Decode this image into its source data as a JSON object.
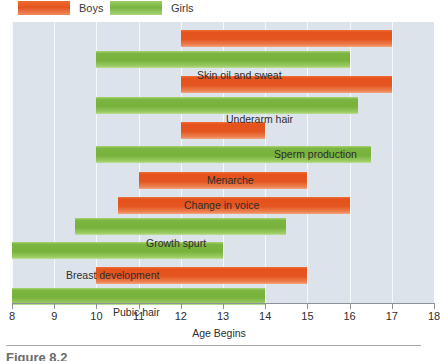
{
  "legend": {
    "items": [
      {
        "label": "Boys",
        "color": "#e4551f",
        "icon": "legend-swatch-boys"
      },
      {
        "label": "Girls",
        "color": "#77b23c",
        "icon": "legend-swatch-girls"
      }
    ]
  },
  "axis": {
    "title": "Age Begins",
    "ticks": [
      "8",
      "9",
      "10",
      "11",
      "12",
      "13",
      "14",
      "15",
      "16",
      "17",
      "18"
    ]
  },
  "caption": {
    "text": "Figure 8.2"
  },
  "chart_data": {
    "type": "bar",
    "orientation": "horizontal",
    "title": "",
    "subtitle": "",
    "xlabel": "Age Begins",
    "ylabel": "",
    "xlim": [
      8,
      18
    ],
    "grid": true,
    "legend_position": "top-left",
    "note": "Paired floating (range) bars: each milestone shows the age span during which it typically begins, separately for boys (orange) and girls (green).",
    "series": [
      {
        "name": "Boys",
        "color": "#e4551f"
      },
      {
        "name": "Girls",
        "color": "#77b23c"
      }
    ],
    "categories": [
      "Skin oil and sweat",
      "Underarm hair",
      "Sperm production",
      "Menarche",
      "Change in voice",
      "Growth spurt",
      "Breast development",
      "Pubic hair"
    ],
    "bars": [
      {
        "label": "Skin oil and sweat",
        "series": "Boys",
        "start": 12.0,
        "end": 17.0
      },
      {
        "label": "Skin oil and sweat",
        "series": "Girls",
        "start": 10.0,
        "end": 16.0
      },
      {
        "label": "Underarm hair",
        "series": "Boys",
        "start": 12.0,
        "end": 17.0
      },
      {
        "label": "Underarm hair",
        "series": "Girls",
        "start": 10.0,
        "end": 16.2
      },
      {
        "label": "Sperm production",
        "series": "Boys",
        "start": 12.0,
        "end": 14.0
      },
      {
        "label": "Menarche",
        "series": "Girls",
        "start": 10.0,
        "end": 16.5
      },
      {
        "label": "Change in voice",
        "series": "Boys",
        "start": 11.0,
        "end": 15.0
      },
      {
        "label": "Growth spurt",
        "series": "Boys",
        "start": 10.5,
        "end": 16.0
      },
      {
        "label": "Growth spurt",
        "series": "Girls",
        "start": 9.5,
        "end": 14.5
      },
      {
        "label": "Breast development",
        "series": "Girls",
        "start": 8.0,
        "end": 13.0
      },
      {
        "label": "Pubic hair",
        "series": "Boys",
        "start": 10.0,
        "end": 15.0
      },
      {
        "label": "Pubic hair",
        "series": "Girls",
        "start": 8.0,
        "end": 14.0
      }
    ],
    "labels_on_chart": [
      "Skin oil and sweat",
      "Underarm hair",
      "Sperm production",
      "Menarche",
      "Change in voice",
      "Growth spurt",
      "Breast development",
      "Pubic hair"
    ]
  }
}
